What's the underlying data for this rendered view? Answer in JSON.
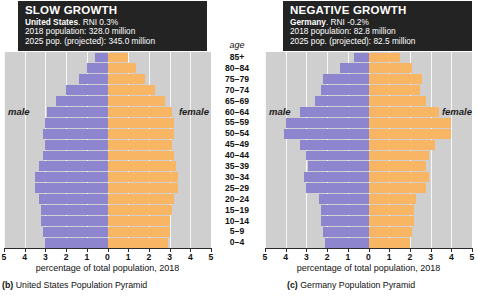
{
  "panels": [
    {
      "id": "us",
      "header": {
        "title": "SLOW GROWTH",
        "country": "United States",
        "rni": ". RNI 0.3%",
        "pop_2018": "2018 population: 328.0 million",
        "pop_2025": "2025 pop. (projected): 345.0 million"
      },
      "male_label": "male",
      "female_label": "female",
      "xtitle": "percentage of total population, 2018",
      "caption_key": "(b)",
      "caption_text": "United States Population Pyramid"
    },
    {
      "id": "de",
      "header": {
        "title": "NEGATIVE GROWTH",
        "country": "Germany",
        "rni": ". RNI -0.2%",
        "pop_2018": "2018 population: 82.8 million",
        "pop_2025": "2025 pop. (projected): 82.5 million"
      },
      "male_label": "male",
      "female_label": "female",
      "xtitle": "percentage of total population, 2018",
      "caption_key": "(c)",
      "caption_text": "Germany Population Pyramid"
    }
  ],
  "age_header": "age",
  "colors": {
    "male": "#8d86cf",
    "female": "#f8b665",
    "plot_background": "#cfcfcf",
    "header_background": "#232323",
    "header_text": "#ffffff"
  },
  "chart_data": [
    {
      "type": "bar",
      "subtype": "population-pyramid",
      "title": "SLOW GROWTH",
      "subject": "United States",
      "xlabel": "percentage of total population, 2018",
      "ylabel": "age",
      "xlim": [
        -5,
        5
      ],
      "xticks": [
        5,
        4,
        3,
        2,
        1,
        0,
        1,
        2,
        3,
        4,
        5
      ],
      "grid": true,
      "legend_position": "inline-side-labels",
      "categories": [
        "85+",
        "80–84",
        "75–79",
        "70–74",
        "65–69",
        "60–64",
        "55–59",
        "50–54",
        "45–49",
        "40–44",
        "35–39",
        "30–34",
        "25–29",
        "20–24",
        "15–19",
        "10–14",
        "5–9",
        "0–4"
      ],
      "series": [
        {
          "name": "male",
          "values": [
            0.6,
            1.0,
            1.4,
            2.0,
            2.5,
            2.9,
            3.0,
            3.1,
            3.0,
            3.1,
            3.3,
            3.5,
            3.5,
            3.3,
            3.2,
            3.2,
            3.1,
            3.0
          ]
        },
        {
          "name": "female",
          "values": [
            1.0,
            1.4,
            1.8,
            2.3,
            2.8,
            3.1,
            3.2,
            3.2,
            3.1,
            3.2,
            3.3,
            3.4,
            3.4,
            3.2,
            3.1,
            3.0,
            3.0,
            2.9
          ]
        }
      ]
    },
    {
      "type": "bar",
      "subtype": "population-pyramid",
      "title": "NEGATIVE GROWTH",
      "subject": "Germany",
      "xlabel": "percentage of total population, 2018",
      "ylabel": "age",
      "xlim": [
        -5,
        5
      ],
      "xticks": [
        5,
        4,
        3,
        2,
        1,
        0,
        1,
        2,
        3,
        4,
        5
      ],
      "grid": true,
      "legend_position": "inline-side-labels",
      "categories": [
        "85+",
        "80–84",
        "75–79",
        "70–74",
        "65–69",
        "60–64",
        "55–59",
        "50–54",
        "45–49",
        "40–44",
        "35–39",
        "30–34",
        "25–29",
        "20–24",
        "15–19",
        "10–14",
        "5–9",
        "0–4"
      ],
      "series": [
        {
          "name": "male",
          "values": [
            0.7,
            1.4,
            2.2,
            2.3,
            2.6,
            3.3,
            4.0,
            4.1,
            3.3,
            3.0,
            2.9,
            3.1,
            3.0,
            2.4,
            2.3,
            2.3,
            2.2,
            2.1
          ]
        },
        {
          "name": "female",
          "values": [
            1.5,
            2.1,
            2.6,
            2.5,
            2.8,
            3.4,
            4.0,
            4.0,
            3.2,
            2.9,
            2.8,
            2.9,
            2.8,
            2.3,
            2.2,
            2.2,
            2.1,
            2.0
          ]
        }
      ]
    }
  ]
}
